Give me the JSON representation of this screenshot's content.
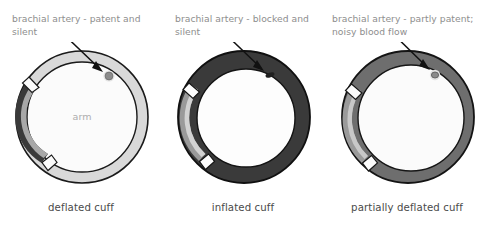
{
  "figure": {
    "background": "#ffffff"
  },
  "colors": {
    "outline": "#1a1a1a",
    "cuff_light": "#d9d9d9",
    "cuff_dark": "#3a3a3a",
    "cuff_medium": "#6e6e6e",
    "strip_light": "#9a9a9a",
    "arm_fill": "#fbfbfb",
    "callout_text": "#8e8e8e",
    "caption_text": "#4a4a4a",
    "arm_text": "#adadad",
    "artery_open": "#8c8c8c",
    "artery_closed": "#1f1f1f"
  },
  "panels": [
    {
      "id": "deflated",
      "callout": "brachial artery - patent and silent",
      "caption": "deflated cuff",
      "arm_label": "arm",
      "cuff_state": "deflated",
      "artery_state": "patent",
      "ring_color": "#d9d9d9",
      "strip_color": "#3a3a3a"
    },
    {
      "id": "inflated",
      "callout": "brachial artery - blocked and silent",
      "caption": "inflated cuff",
      "arm_label": "",
      "cuff_state": "inflated",
      "artery_state": "blocked",
      "ring_color": "#3a3a3a",
      "strip_color": "#9a9a9a"
    },
    {
      "id": "partially-deflated",
      "callout": "brachial artery - partly patent; noisy blood flow",
      "caption": "partially deflated cuff",
      "arm_label": "",
      "cuff_state": "partially deflated",
      "artery_state": "partly patent",
      "ring_color": "#6e6e6e",
      "strip_color": "#9a9a9a"
    }
  ]
}
